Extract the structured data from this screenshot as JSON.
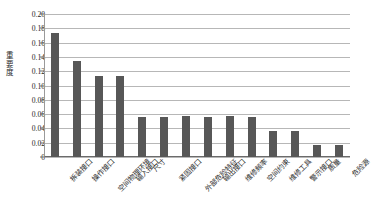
{
  "chart_data": {
    "type": "bar",
    "title": "",
    "xlabel": "",
    "ylabel": "重要度",
    "ylim": [
      0,
      0.2
    ],
    "ytick_labels": [
      "0.20",
      "0.18",
      "0.16",
      "0.14",
      "0.12",
      "0.10",
      "0.08",
      "0.06",
      "0.04",
      "0.02",
      "0"
    ],
    "ytick_values": [
      0.2,
      0.18,
      0.16,
      0.14,
      0.12,
      0.1,
      0.08,
      0.06,
      0.04,
      0.02,
      0
    ],
    "grid": true,
    "legend": false,
    "bar_color": "#575757",
    "categories": [
      "拆装接口",
      "操作接口",
      "空间物理环境",
      "输入接口",
      "尺寸",
      "紧固接口",
      "外部危险特征",
      "输出接口",
      "维修频率",
      "空间约束",
      "维修工具",
      "警示接口",
      "质量",
      "危险源"
    ],
    "values": [
      0.173,
      0.134,
      0.113,
      0.114,
      0.056,
      0.056,
      0.057,
      0.056,
      0.057,
      0.056,
      0.037,
      0.037,
      0.017,
      0.017
    ]
  }
}
